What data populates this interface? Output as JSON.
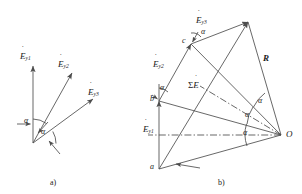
{
  "figure": {
    "type": "vector-phasor-diagram",
    "background": "#ffffff",
    "line_color": "#4d4d4d",
    "text_color": "#1a1a1a",
    "captions": {
      "left": "a)",
      "right": "b)"
    }
  },
  "panel_a": {
    "caption": "a)",
    "description": "Three phasors drawn from a common origin, each separated by the angle alpha",
    "origin_label": "",
    "vectors": [
      {
        "name": "E-y1",
        "letter": "E",
        "subscript": "y1",
        "dot": "˙",
        "angle_deg": 90
      },
      {
        "name": "E-y2",
        "letter": "E",
        "subscript": "y2",
        "dot": "˙",
        "angle_deg": 62
      },
      {
        "name": "E-y3",
        "letter": "E",
        "subscript": "y3",
        "dot": "˙",
        "angle_deg": 28
      }
    ],
    "angles": [
      {
        "label": "α",
        "between": "E-y1 and E-y2"
      },
      {
        "label": "α",
        "between": "E-y2 and E-y3"
      }
    ]
  },
  "panel_b": {
    "caption": "b)",
    "description": "Geometric construction of the phasor sum: chords ab, bc, cd subtend equal angles alpha at the circle centre O, resultant sum E shown as chord ad",
    "points": [
      {
        "name": "point-a",
        "label": "a"
      },
      {
        "name": "point-b",
        "label": "b"
      },
      {
        "name": "point-c",
        "label": "c"
      },
      {
        "name": "point-O",
        "label": "O"
      }
    ],
    "labels": [
      {
        "name": "E-y1",
        "letter": "E",
        "subscript": "y1",
        "dot": "˙"
      },
      {
        "name": "E-y2",
        "letter": "E",
        "subscript": "y2",
        "dot": "˙"
      },
      {
        "name": "E-y3",
        "letter": "E",
        "subscript": "y3",
        "dot": "˙"
      },
      {
        "name": "sum-E",
        "sigma": "Σ",
        "letter": "E",
        "dot": "˙"
      },
      {
        "name": "radius-R",
        "label": "R"
      }
    ],
    "angles": [
      {
        "label": "α",
        "at": "vertex-b"
      },
      {
        "label": "α",
        "at": "vertex-c"
      },
      {
        "label": "α",
        "at": "vertex-O-upper"
      },
      {
        "label": "α",
        "at": "vertex-O-middle"
      },
      {
        "label": "α",
        "at": "vertex-O-lower"
      }
    ]
  }
}
